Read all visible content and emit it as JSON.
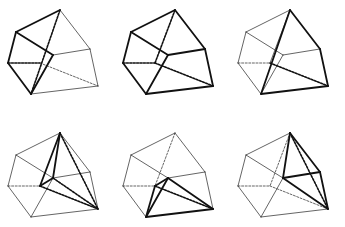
{
  "figure": {
    "title": "",
    "layout": {
      "rows": 2,
      "cols": 3,
      "col_offset": 115,
      "row_offset": 123
    },
    "colors": {
      "stroke": "#111111",
      "thin": "#222222",
      "background": "#ffffff"
    },
    "base_vertices": {
      "T": [
        60,
        10
      ],
      "A": [
        16,
        32
      ],
      "B": [
        8,
        63
      ],
      "C": [
        31,
        94
      ],
      "M": [
        53,
        55
      ],
      "R": [
        90,
        49
      ],
      "Q": [
        98,
        86
      ],
      "X": [
        40,
        63
      ]
    },
    "base_edges": [
      [
        "T",
        "A"
      ],
      [
        "A",
        "B"
      ],
      [
        "B",
        "C"
      ],
      [
        "C",
        "Q"
      ],
      [
        "Q",
        "R"
      ],
      [
        "R",
        "T"
      ],
      [
        "A",
        "M"
      ],
      [
        "M",
        "R"
      ],
      [
        "M",
        "C"
      ]
    ],
    "panels": [
      {
        "id": "p1",
        "row": 0,
        "col": 0,
        "bold": [
          [
            "T",
            "A"
          ],
          [
            "A",
            "B"
          ],
          [
            "B",
            "C"
          ],
          [
            "A",
            "M"
          ],
          [
            "M",
            "C"
          ]
        ],
        "dashed_bold": [
          [
            "T",
            "C"
          ],
          [
            "B",
            "X"
          ]
        ],
        "dashed": [
          [
            "X",
            "Q"
          ]
        ]
      },
      {
        "id": "p2",
        "row": 0,
        "col": 1,
        "bold": [
          [
            "T",
            "A"
          ],
          [
            "A",
            "B"
          ],
          [
            "B",
            "C"
          ],
          [
            "C",
            "Q"
          ],
          [
            "Q",
            "R"
          ],
          [
            "R",
            "T"
          ],
          [
            "A",
            "M"
          ],
          [
            "M",
            "R"
          ],
          [
            "M",
            "C"
          ]
        ],
        "dashed_bold": [
          [
            "T",
            "X"
          ],
          [
            "B",
            "X"
          ],
          [
            "X",
            "Q"
          ]
        ],
        "dashed": []
      },
      {
        "id": "p3",
        "row": 0,
        "col": 2,
        "bold": [
          [
            "T",
            "R"
          ],
          [
            "R",
            "Q"
          ],
          [
            "Q",
            "C"
          ],
          [
            "T",
            "C"
          ]
        ],
        "dashed_bold": [
          [
            "X",
            "Q"
          ]
        ],
        "dashed": [
          [
            "B",
            "X"
          ]
        ],
        "extra_thin": [
          [
            "T",
            "X"
          ]
        ]
      },
      {
        "id": "p4",
        "row": 1,
        "col": 0,
        "bold": [
          [
            "T",
            "X"
          ],
          [
            "X",
            "M"
          ],
          [
            "T",
            "M"
          ]
        ],
        "dashed_bold": [
          [
            "T",
            "Q"
          ],
          [
            "X",
            "Q"
          ],
          [
            "M",
            "Q"
          ]
        ],
        "dashed": [
          [
            "B",
            "X"
          ]
        ]
      },
      {
        "id": "p5",
        "row": 1,
        "col": 1,
        "bold": [
          [
            "M",
            "C"
          ],
          [
            "C",
            "Q"
          ],
          [
            "M",
            "Q"
          ],
          [
            "X",
            "C"
          ],
          [
            "X",
            "M"
          ]
        ],
        "dashed_bold": [
          [
            "X",
            "Q"
          ]
        ],
        "dashed": [
          [
            "T",
            "X"
          ],
          [
            "B",
            "X"
          ]
        ]
      },
      {
        "id": "p6",
        "row": 1,
        "col": 2,
        "bold": [
          [
            "T",
            "R"
          ],
          [
            "R",
            "Q"
          ],
          [
            "M",
            "R"
          ],
          [
            "T",
            "M"
          ],
          [
            "M",
            "Q"
          ]
        ],
        "dashed_bold": [
          [
            "T",
            "Q"
          ]
        ],
        "dashed": [
          [
            "T",
            "X"
          ],
          [
            "B",
            "X"
          ],
          [
            "X",
            "Q"
          ]
        ]
      }
    ]
  }
}
